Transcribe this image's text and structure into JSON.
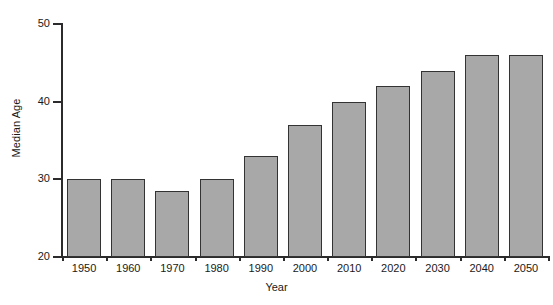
{
  "chart_data": {
    "type": "bar",
    "title": "",
    "subtitle": "",
    "xlabel": "Year",
    "ylabel": "Median Age",
    "categories": [
      "1950",
      "1960",
      "1970",
      "1980",
      "1990",
      "2000",
      "2010",
      "2020",
      "2030",
      "2040",
      "2050"
    ],
    "values": [
      30,
      30,
      28.5,
      30,
      33,
      37,
      40,
      42,
      44,
      46,
      46
    ],
    "ylim": [
      20,
      50
    ],
    "yticks": [
      "20",
      "30",
      "40",
      "50"
    ],
    "ytick_values": [
      20,
      30,
      40,
      50
    ],
    "grid": false,
    "legend": false,
    "legend_position": "none",
    "series": [
      {
        "name": "Median Age",
        "values": [
          30,
          30,
          28.5,
          30,
          33,
          37,
          40,
          42,
          44,
          46,
          46
        ]
      }
    ],
    "annotations": []
  },
  "style": {
    "bar_fill": "#a8a8a8",
    "bar_border": "#333333",
    "axis_color": "#2b2b2b",
    "background": "#ffffff",
    "text_color": "#1a1a1a"
  }
}
